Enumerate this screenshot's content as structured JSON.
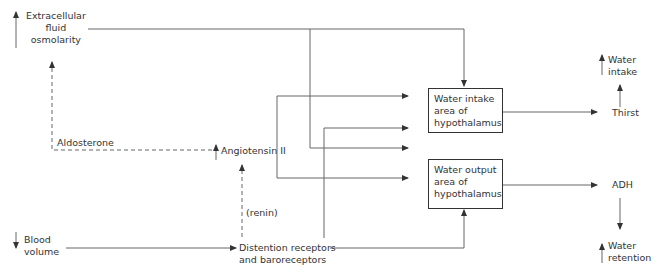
{
  "nodes": {
    "ecf_osmolarity": {
      "line1": "Extracellular",
      "line2": "fluid",
      "line3": "osmolarity",
      "direction": "up"
    },
    "aldosterone": {
      "label": "Aldosterone"
    },
    "angiotensin": {
      "label": "Angiotensin II",
      "direction": "up"
    },
    "renin": {
      "label": "(renin)"
    },
    "blood_volume": {
      "line1": "Blood",
      "line2": "volume",
      "direction": "down"
    },
    "receptors": {
      "line1": "Distention receptors",
      "line2": "and baroreceptors"
    },
    "intake_area": {
      "line1": "Water intake",
      "line2": "area of",
      "line3": "hypothalamus"
    },
    "output_area": {
      "line1": "Water output",
      "line2": "area of",
      "line3": "hypothalamus"
    },
    "thirst": {
      "label": "Thirst"
    },
    "water_intake": {
      "line1": "Water",
      "line2": "intake",
      "direction": "up"
    },
    "adh": {
      "label": "ADH"
    },
    "water_retention": {
      "line1": "Water",
      "line2": "retention",
      "direction": "up"
    }
  },
  "colors": {
    "line": "#555555",
    "text": "#333333"
  }
}
